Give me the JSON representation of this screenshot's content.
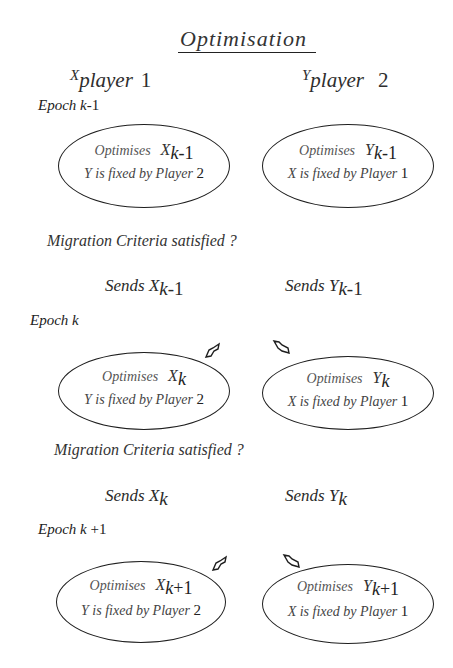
{
  "title": "Optimisation",
  "players": [
    {
      "symbol": "X",
      "label": "player",
      "number": "1"
    },
    {
      "symbol": "Y",
      "label": "player",
      "number": "2"
    }
  ],
  "epochs": [
    {
      "label_prefix": "Epoch ",
      "label_var": "k",
      "label_suffix": "-1",
      "left": {
        "line1": "Optimises",
        "var": "X",
        "sub": "k",
        "sub_suffix": "-1",
        "line2": "Y is fixed by Player ",
        "line2_num": "2"
      },
      "right": {
        "line1": "Optimises",
        "var": "Y",
        "sub": "k",
        "sub_suffix": "-1",
        "line2": "X is fixed by Player ",
        "line2_num": "1"
      }
    },
    {
      "label_prefix": "Epoch ",
      "label_var": "k",
      "label_suffix": "",
      "left": {
        "line1": "Optimises",
        "var": "X",
        "sub": "k",
        "sub_suffix": "",
        "line2": "Y is fixed by Player ",
        "line2_num": "2"
      },
      "right": {
        "line1": "Optimises",
        "var": "Y",
        "sub": "k",
        "sub_suffix": "",
        "line2": "X is fixed by Player ",
        "line2_num": "1"
      }
    },
    {
      "label_prefix": "Epoch ",
      "label_var": "k",
      "label_suffix": " +1",
      "left": {
        "line1": "Optimises",
        "var": "X",
        "sub": "k",
        "sub_suffix": "+1",
        "line2": "Y is fixed by Player ",
        "line2_num": "2"
      },
      "right": {
        "line1": "Optimises",
        "var": "Y",
        "sub": "k",
        "sub_suffix": "+1",
        "line2": "X is fixed by Player ",
        "line2_num": "1"
      }
    }
  ],
  "transitions": [
    {
      "question": "Migration Criteria satisfied ?",
      "left_send": {
        "prefix": "Sends ",
        "var": "X",
        "sub": "k",
        "sub_suffix": "-1"
      },
      "right_send": {
        "prefix": "Sends ",
        "var": "Y",
        "sub": "k",
        "sub_suffix": "-1"
      }
    },
    {
      "question": "Migration Criteria satisfied ?",
      "left_send": {
        "prefix": "Sends ",
        "var": "X",
        "sub": "k",
        "sub_suffix": ""
      },
      "right_send": {
        "prefix": "Sends ",
        "var": "Y",
        "sub": "k",
        "sub_suffix": ""
      }
    }
  ],
  "colors": {
    "ink": "#1e1e1e",
    "text": "#2a2a2a",
    "background": "#ffffff"
  }
}
